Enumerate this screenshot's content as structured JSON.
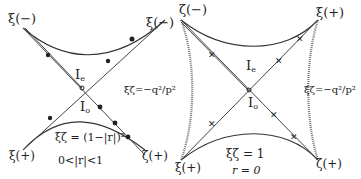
{
  "left_panel": {
    "corner_labels": {
      "top_left": "ξ(−)",
      "top_right": "ξ(−)",
      "bottom_left": "ξ(+)",
      "bottom_right": "ζ(+)"
    },
    "region_upper": "I",
    "region_upper_sub": "e",
    "region_lower": "I",
    "region_lower_sub": "o",
    "curve_label": "ξζ = (1−|r|)²",
    "condition": "0<|r|<1"
  },
  "right_panel": {
    "corner_labels": {
      "top_left": "ζ(−)",
      "top_right": "ξ(+)",
      "bottom_left": "ξ(+)",
      "bottom_right": "ζ(+)"
    },
    "region_upper": "I",
    "region_upper_sub": "e",
    "region_lower": "I",
    "region_lower_sub": "o",
    "side_label_left": "ξζ=−q²/p²",
    "side_label_right": "ξζ=−q²/p²",
    "curve_label": "ξζ = 1",
    "condition": "r = 0"
  }
}
